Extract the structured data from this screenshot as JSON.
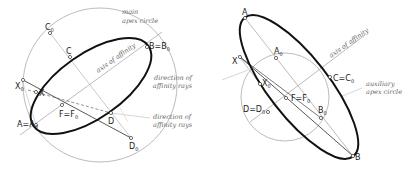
{
  "left_figure": {
    "annotations": {
      "main_apex_circle_1": "main",
      "main_apex_circle_2": "apex circle",
      "axis": "axis of affinity",
      "direction_1": "direction of",
      "direction_2": "affinity rays"
    },
    "points": {
      "C0": "C",
      "C0_sub": "0",
      "C": "C",
      "B": "B=B",
      "B_sub": "0",
      "X0": "X",
      "X0_sub": "0",
      "X": "X",
      "F": "F=F",
      "F_sub": "0",
      "A": "A=A",
      "A_sub": "0",
      "D": "D",
      "D0": "D",
      "D0_sub": "0"
    }
  },
  "right_figure": {
    "annotations": {
      "axis": "axis of affinity",
      "direction_1": "direction of",
      "direction_2": "affinity rays",
      "aux_1": "auxiliary",
      "aux_2": "apex circle"
    },
    "points": {
      "A": "A",
      "A0": "A",
      "A0_sub": "0",
      "X": "X",
      "X0": "X",
      "X0_sub": "0",
      "C": "C=C",
      "C_sub": "0",
      "F": "F=F",
      "F_sub": "0",
      "D": "D=D",
      "D_sub": "0",
      "B0": "B",
      "B0_sub": "0",
      "B": "B"
    }
  },
  "colors": {
    "ellipse": "#111111",
    "construction": "#9a9a9a",
    "lines": "#555555"
  }
}
